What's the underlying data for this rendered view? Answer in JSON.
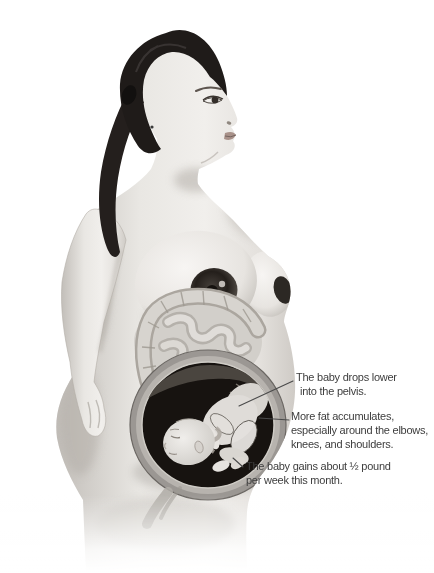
{
  "page": {
    "background": "#ffffff"
  },
  "figure": {
    "name": "pregnant-woman-ninth-month",
    "colors": {
      "skin_highlight": "#f1efec",
      "skin_shadow": "#c2beb9",
      "hair": "#1f1b19",
      "areola": "#241f1b",
      "intestines": "#d2cfca",
      "uterus_wall": "#9b9793",
      "womb_interior": "#171310",
      "fetus_skin": "#dfdcd8",
      "annotation_text": "#3d3d3d",
      "leader_line": "#4a4a4a"
    }
  },
  "annotations": [
    {
      "id": "baby-drops",
      "lines": [
        "The baby drops lower",
        "into the pelvis."
      ]
    },
    {
      "id": "fat-accumulates",
      "lines": [
        "More fat accumulates,",
        "especially around the elbows,",
        "knees, and shoulders."
      ]
    },
    {
      "id": "weight-gain",
      "lines": [
        "The baby gains about ½ pound",
        "per week this month."
      ]
    }
  ]
}
